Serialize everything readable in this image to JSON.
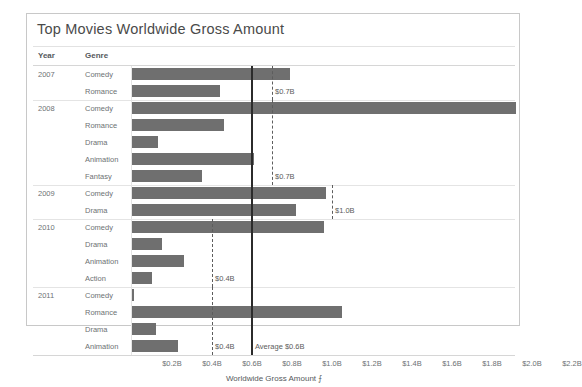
{
  "chart_data": {
    "type": "bar",
    "title": "Top Movies Worldwide Gross Amount",
    "xlabel": "Worldwide Gross Amount",
    "ylabel": "",
    "orientation": "horizontal",
    "xlim": [
      0,
      2.3
    ],
    "xticks": [
      "$0.2B",
      "$0.4B",
      "$0.6B",
      "$0.8B",
      "$1.0B",
      "$1.2B",
      "$1.4B",
      "$1.6B",
      "$1.8B",
      "$2.0B",
      "$2.2B"
    ],
    "xtick_values": [
      0.2,
      0.4,
      0.6,
      0.8,
      1.0,
      1.2,
      1.4,
      1.6,
      1.8,
      2.0,
      2.2
    ],
    "grid": false,
    "legend": null,
    "bar_color": "#6f6f6f",
    "row_headers": [
      "Year",
      "Genre"
    ],
    "groups": [
      {
        "year": "2007",
        "rows": [
          {
            "genre": "Comedy",
            "value": 0.79
          },
          {
            "genre": "Romance",
            "value": 0.44
          }
        ],
        "reference_line": {
          "value": 0.7,
          "label": "$0.7B",
          "style": "dashed"
        }
      },
      {
        "year": "2008",
        "rows": [
          {
            "genre": "Comedy",
            "value": 1.92
          },
          {
            "genre": "Romance",
            "value": 0.46
          },
          {
            "genre": "Drama",
            "value": 0.13
          },
          {
            "genre": "Animation",
            "value": 0.61
          },
          {
            "genre": "Fantasy",
            "value": 0.35
          }
        ],
        "reference_line": {
          "value": 0.7,
          "label": "$0.7B",
          "style": "dashed"
        }
      },
      {
        "year": "2009",
        "rows": [
          {
            "genre": "Comedy",
            "value": 0.97
          },
          {
            "genre": "Drama",
            "value": 0.82
          }
        ],
        "reference_line": {
          "value": 1.0,
          "label": "$1.0B",
          "style": "dashed"
        }
      },
      {
        "year": "2010",
        "rows": [
          {
            "genre": "Comedy",
            "value": 0.96
          },
          {
            "genre": "Drama",
            "value": 0.15
          },
          {
            "genre": "Animation",
            "value": 0.26
          },
          {
            "genre": "Action",
            "value": 0.1
          }
        ],
        "reference_line": {
          "value": 0.4,
          "label": "$0.4B",
          "style": "dashed"
        }
      },
      {
        "year": "2011",
        "rows": [
          {
            "genre": "Comedy",
            "value": 0.01
          },
          {
            "genre": "Romance",
            "value": 1.05
          },
          {
            "genre": "Drama",
            "value": 0.12
          },
          {
            "genre": "Animation",
            "value": 0.23
          }
        ],
        "reference_line": {
          "value": 0.4,
          "label": "$0.4B",
          "style": "dashed"
        }
      }
    ],
    "average_line": {
      "value": 0.6,
      "label": "Average $0.6B",
      "style": "solid"
    },
    "annotations": [
      "$0.7B",
      "$0.7B",
      "$1.0B",
      "$0.4B",
      "$0.4B",
      "Average $0.6B"
    ],
    "sort_indicator": "⨍"
  }
}
